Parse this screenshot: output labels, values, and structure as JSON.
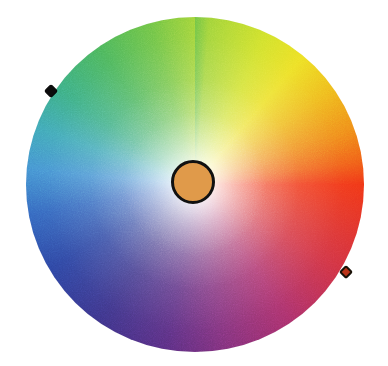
{
  "canvas": {
    "width": 388,
    "height": 366,
    "background": "#ffffff"
  },
  "widget": {
    "name": "color-wheel-picker",
    "title": "Color Wheel",
    "type": "hsv-color-wheel"
  },
  "wheel": {
    "label": "Hue / saturation color wheel",
    "center_x": 195,
    "center_y": 184,
    "radius": 169,
    "bounds": {
      "left": 26,
      "top": 17,
      "width": 338,
      "height": 335
    },
    "hue_origin_deg": 0,
    "hue_direction": "counter-clockwise",
    "saturation_mode": "radial (white at centre, full saturation at rim)",
    "hue_stops": [
      {
        "angle_deg": 0,
        "position": "east",
        "hex": "#f03010",
        "name": "red"
      },
      {
        "angle_deg": 30,
        "position": "east-northeast",
        "hex": "#d02c3c",
        "name": "crimson"
      },
      {
        "angle_deg": 55,
        "position": "northeast",
        "hex": "#a82a66",
        "name": "magenta"
      },
      {
        "angle_deg": 80,
        "position": "north-northeast",
        "hex": "#7c2a77",
        "name": "purple"
      },
      {
        "angle_deg": 100,
        "position": "north",
        "hex": "#55287e",
        "name": "violet"
      },
      {
        "angle_deg": 125,
        "position": "north-northwest",
        "hex": "#372e86",
        "name": "indigo"
      },
      {
        "angle_deg": 150,
        "position": "northwest",
        "hex": "#27409f",
        "name": "deep blue"
      },
      {
        "angle_deg": 170,
        "position": "west-northwest",
        "hex": "#2f63bd",
        "name": "blue"
      },
      {
        "angle_deg": 185,
        "position": "west",
        "hex": "#3f8fd0",
        "name": "azure"
      },
      {
        "angle_deg": 200,
        "position": "west",
        "hex": "#3aa5b4",
        "name": "cyan"
      },
      {
        "angle_deg": 215,
        "position": "west-southwest",
        "hex": "#36ab80",
        "name": "teal"
      },
      {
        "angle_deg": 235,
        "position": "southwest",
        "hex": "#46b356",
        "name": "green"
      },
      {
        "angle_deg": 255,
        "position": "south-southwest",
        "hex": "#6cc23f",
        "name": "leaf green"
      },
      {
        "angle_deg": 275,
        "position": "south",
        "hex": "#9ed233",
        "name": "yellow-green"
      },
      {
        "angle_deg": 295,
        "position": "south-southeast",
        "hex": "#cfe025",
        "name": "chartreuse"
      },
      {
        "angle_deg": 310,
        "position": "southeast",
        "hex": "#ecdf1e",
        "name": "yellow"
      },
      {
        "angle_deg": 325,
        "position": "east-southeast",
        "hex": "#eeb916",
        "name": "amber"
      },
      {
        "angle_deg": 340,
        "position": "east-southeast",
        "hex": "#ef8a12",
        "name": "orange"
      },
      {
        "angle_deg": 352,
        "position": "east",
        "hex": "#f05a10",
        "name": "orange-red"
      }
    ]
  },
  "center_swatch": {
    "label": "Selected color preview",
    "fill": "#e09a4a",
    "outline": "#111111",
    "center_x": 193,
    "center_y": 182,
    "radius": 22
  },
  "markers": [
    {
      "id": "marker-primary",
      "label": "Primary hue handle",
      "shape": "diamond",
      "fill": "#0c0c0c",
      "outline": "#000000",
      "x": 51,
      "y": 91,
      "size": 10
    },
    {
      "id": "marker-secondary",
      "label": "Secondary hue handle",
      "shape": "diamond",
      "fill": "#bb3418",
      "outline": "#1a1208",
      "x": 346,
      "y": 272,
      "size": 10
    }
  ]
}
